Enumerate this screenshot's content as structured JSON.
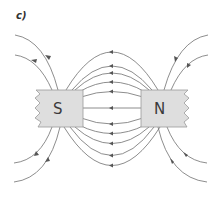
{
  "figure": {
    "label": "c)",
    "magnets": [
      {
        "pole": "S",
        "side": "left"
      },
      {
        "pole": "N",
        "side": "right"
      }
    ],
    "field_direction": "from N to S",
    "colors": {
      "field_line": "#707070",
      "arrow": "#555555",
      "magnet_fill": "#dedede",
      "magnet_stroke": "#9a9a9a",
      "pole_text": "#3a3a3a"
    }
  }
}
